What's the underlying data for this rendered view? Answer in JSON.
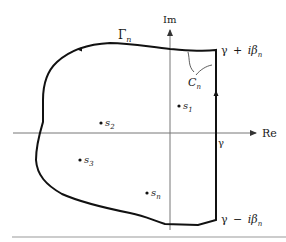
{
  "diagram": {
    "axes": {
      "real_label": "Re",
      "imag_label": "Im"
    },
    "contour": {
      "outer_label": "Γ",
      "outer_subscript": "n",
      "inner_label": "C",
      "inner_subscript": "n"
    },
    "line_labels": {
      "gamma": "γ",
      "top_gamma": "γ",
      "top_plus": "+",
      "top_i_beta": "iβ",
      "top_sub": "n",
      "bottom_gamma": "γ",
      "bottom_minus": "−",
      "bottom_i_beta": "iβ",
      "bottom_sub": "n"
    },
    "points": [
      {
        "name": "s",
        "sub": "1"
      },
      {
        "name": "s",
        "sub": "2"
      },
      {
        "name": "s",
        "sub": "3"
      },
      {
        "name": "s",
        "sub": "n"
      }
    ],
    "colors": {
      "contour": "#111111",
      "axes": "#777777",
      "text": "#1a1a1a"
    }
  }
}
